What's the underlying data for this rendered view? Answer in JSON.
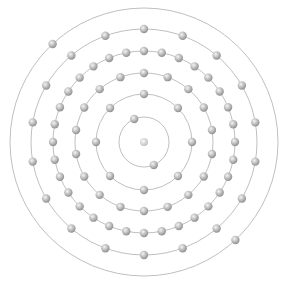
{
  "diagram": {
    "element": "Mercury",
    "symbol": "Hg",
    "atomic_number": 80,
    "electron_configuration": [
      2,
      8,
      18,
      32,
      18,
      2
    ],
    "center": [
      144,
      142
    ],
    "colors": {
      "background": "#ffffff",
      "orbit": "#b8b8b8",
      "electron_dark": "#8a8a8a",
      "electron_light": "#e6e6e6",
      "nucleus_dark": "#b0b0b0",
      "nucleus_light": "#f2f2f2"
    },
    "nucleus": {
      "radius": 4
    },
    "electron_radius": 4.2,
    "shells": [
      {
        "n": 1,
        "radius": 25,
        "electrons": 2,
        "start_angle_deg": -113
      },
      {
        "n": 2,
        "radius": 48,
        "electrons": 8,
        "start_angle_deg": -90
      },
      {
        "n": 3,
        "radius": 69,
        "electrons": 18,
        "start_angle_deg": -90
      },
      {
        "n": 4,
        "radius": 91,
        "electrons": 32,
        "start_angle_deg": -90
      },
      {
        "n": 5,
        "radius": 113,
        "electrons": 18,
        "start_angle_deg": -90
      },
      {
        "n": 6,
        "radius": 134,
        "electrons": 2,
        "start_angle_deg": -133
      }
    ]
  }
}
